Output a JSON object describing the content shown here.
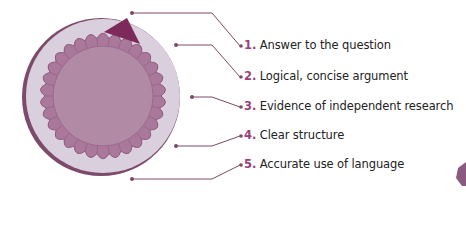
{
  "colors": {
    "outer_ring": "#d9ccdb",
    "outer_shadow": "#7d4a6b",
    "gear": "#a9789a",
    "gear_edge": "#8e5b7f",
    "inner_disc": "#b0829f",
    "pointer": "#7c2a5b",
    "leader_line": "#7a4a66",
    "number": "#9b3f7a",
    "text": "#222222",
    "corner_shape": "#8a5a80"
  },
  "items": [
    {
      "number": "1.",
      "text": "Answer to the question"
    },
    {
      "number": "2.",
      "text": "Logical, concise argument"
    },
    {
      "number": "3.",
      "text": "Evidence of independent research"
    },
    {
      "number": "4.",
      "text": "Clear structure"
    },
    {
      "number": "5.",
      "text": "Accurate use of language"
    }
  ]
}
